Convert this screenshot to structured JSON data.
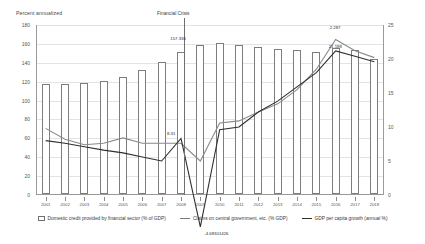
{
  "chart_data": {
    "type": "bar",
    "title": "",
    "ylabel": "Percent annualized",
    "xlabel": "",
    "categories": [
      "2001",
      "2002",
      "2003",
      "2004",
      "2005",
      "2006",
      "2007",
      "2008",
      "2009",
      "2010",
      "2011",
      "2012",
      "2013",
      "2014",
      "2015",
      "2016",
      "2017",
      "2018"
    ],
    "ylim": [
      0,
      180
    ],
    "ylim_right": [
      0,
      25
    ],
    "yticks": [
      "180",
      "160",
      "140",
      "120",
      "100",
      "80",
      "60",
      "40",
      "20",
      "0"
    ],
    "yticks_right": [
      "25",
      "20",
      "15",
      "10",
      "5",
      "0"
    ],
    "grid": true,
    "legend_position": "bottom",
    "annotations": [
      {
        "text": "Financial Crisis",
        "x_category": "2008"
      },
      {
        "text": "157.336",
        "series": "Domestic credit provided by financial sector (% of GDP)",
        "x_category": "2009",
        "value": 157.336
      },
      {
        "text": "8.31",
        "series": "GDP per capita growth (annual %)",
        "x_category": "2008",
        "value": 8.31
      },
      {
        "text": "-4.68301426",
        "series": "GDP per capita growth (annual %)",
        "x_category": "2009",
        "value": -4.683
      },
      {
        "text": "2.287",
        "series": "Claims on central government, etc. (% GDP)",
        "x_category": "2016",
        "value": 22.87
      },
      {
        "text": "21.188",
        "series": "GDP per capita growth (annual %)",
        "x_category": "2016",
        "value": 21.188
      }
    ],
    "series": [
      {
        "name": "Domestic credit provided by financial sector (% of GDP)",
        "type": "bar",
        "axis": "left",
        "values": [
          116,
          116,
          118,
          120,
          124,
          131,
          140,
          150,
          157.336,
          160,
          158,
          156,
          154,
          152,
          150,
          155,
          152,
          143
        ]
      },
      {
        "name": "Claims on central government, etc. (% GDP)",
        "type": "line",
        "axis": "right",
        "values": [
          9.8,
          8.2,
          7.4,
          7.6,
          8.4,
          7.6,
          7.6,
          7.6,
          5.0,
          10.6,
          10.9,
          12.2,
          13.4,
          15.5,
          18.5,
          22.87,
          21.2,
          20.2
        ]
      },
      {
        "name": "GDP per capita growth (annual %)",
        "type": "line",
        "axis": "right",
        "values": [
          8.0,
          7.6,
          7.1,
          6.6,
          6.2,
          5.6,
          5.0,
          8.31,
          -4.683,
          9.6,
          10.0,
          12.2,
          13.8,
          15.9,
          18.0,
          21.188,
          20.4,
          19.6
        ]
      }
    ]
  },
  "legend": {
    "items": [
      {
        "label": "Domestic credit provided by financial sector (% of GDP)",
        "marker": "box"
      },
      {
        "label": "Claims on central government, etc. (% GDP)",
        "marker": "line"
      },
      {
        "label": "GDP per capita growth (annual %)",
        "marker": "line-dark"
      }
    ]
  },
  "colors": {
    "bar_stroke": "#7d7d7d",
    "line_claims": "#8a8a8a",
    "line_gdp": "#2f2f2f",
    "grid": "#e3e3e3",
    "axis": "#9a9a9a"
  }
}
